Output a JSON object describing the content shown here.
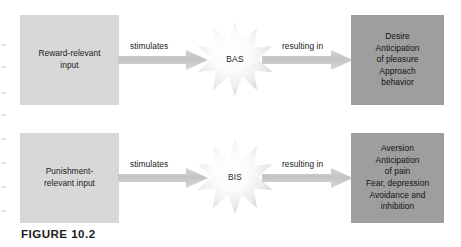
{
  "figure": {
    "caption": "FIGURE 10.2",
    "colors": {
      "input_box_fill": "#d8d8d8",
      "outcome_box_fill": "#9e9e9e",
      "arrow_fill": "#c9c9c9",
      "star_fill_center": "#ffffff",
      "star_fill_edge": "#d9d9d9",
      "text": "#1a1a1a",
      "background": "#ffffff"
    }
  },
  "rows": [
    {
      "id": "bas-row",
      "input_box": {
        "text": "Reward-relevant\ninput"
      },
      "arrow_in_label": "stimulates",
      "node": {
        "label": "BAS",
        "shape": "starburst"
      },
      "arrow_out_label": "resulting in",
      "outcome_box": {
        "text": "Desire\nAnticipation\nof pleasure\nApproach\nbehavior"
      }
    },
    {
      "id": "bis-row",
      "input_box": {
        "text": "Punishment-\nrelevant input"
      },
      "arrow_in_label": "stimulates",
      "node": {
        "label": "BIS",
        "shape": "starburst"
      },
      "arrow_out_label": "resulting in",
      "outcome_box": {
        "text": "Aversion\nAnticipation\nof pain\nFear, depression\nAvoidance and\ninhibition"
      }
    }
  ]
}
